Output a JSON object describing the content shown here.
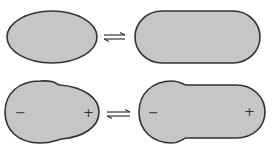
{
  "diagram": {
    "rows": [
      {
        "left_shape": "ellipse",
        "right_shape": "elongated-capsule",
        "relation": "equilibrium"
      },
      {
        "left_shape": "bulged-ellipse",
        "right_shape": "elongated-bulged-capsule",
        "relation": "equilibrium",
        "left_labels": {
          "minus": "−",
          "plus": "+"
        },
        "right_labels": {
          "minus": "−",
          "plus": "+"
        }
      }
    ],
    "colors": {
      "fill": "#c6c6c6",
      "stroke": "#333333"
    }
  }
}
